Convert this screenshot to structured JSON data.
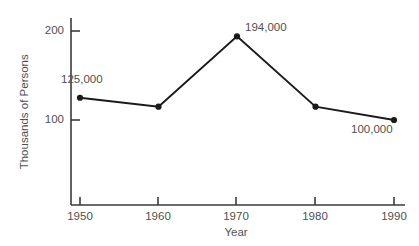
{
  "chart_data": {
    "type": "line",
    "title": "",
    "xlabel": "Year",
    "ylabel": "Thousands of Persons",
    "x": [
      1950,
      1960,
      1970,
      1980,
      1990
    ],
    "xtick_labels": [
      "1950",
      "1960",
      "1970",
      "1980",
      "1990"
    ],
    "ytick_labels": [
      "100",
      "200"
    ],
    "yticks": [
      100,
      200
    ],
    "values": [
      125,
      115,
      194,
      115,
      100
    ],
    "series": [
      {
        "name": "Persons",
        "values": [
          125,
          115,
          194,
          115,
          100
        ]
      }
    ],
    "xlim": [
      1946,
      1992
    ],
    "ylim": [
      0,
      218
    ],
    "grid": false,
    "legend": "none",
    "marker": "filled-circle",
    "line_color": "#1a1a1a",
    "marker_color": "#1a1a1a",
    "text_color": "#4f4f4f",
    "background_color": "#ffffff",
    "annotations": [
      {
        "text": "125,000",
        "x": 1950,
        "y": 125,
        "position": "above-left"
      },
      {
        "text": "194,000",
        "x": 1970,
        "y": 194,
        "position": "above-right"
      },
      {
        "text": "100,000",
        "x": 1990,
        "y": 100,
        "position": "below-left"
      }
    ]
  },
  "axes": {
    "y_title": "Thousands of Persons",
    "x_title": "Year",
    "y_labels": {
      "upper": "200",
      "lower": "100"
    },
    "x_labels": {
      "t1": "1950",
      "t2": "1960",
      "t3": "1970",
      "t4": "1980",
      "t5": "1990"
    }
  },
  "data_labels": {
    "first": "125,000",
    "peak": "194,000",
    "last": "100,000"
  }
}
